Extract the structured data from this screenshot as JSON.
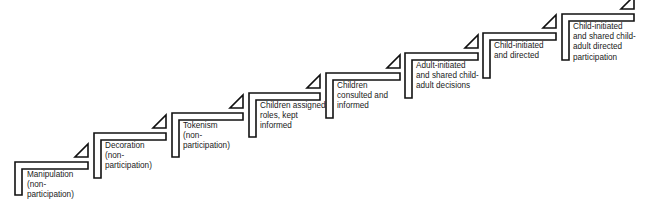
{
  "diagram": {
    "type": "ladder-of-participation-staircase",
    "colors": {
      "stroke": "#111111",
      "fill": "#ffffff",
      "text": "#1a1a1a"
    },
    "steps": [
      {
        "label": "Manipulation\n(non-\nparticipation)",
        "x": 15,
        "y": 162,
        "w": 73,
        "h": 33,
        "lx": 27,
        "ly": 170
      },
      {
        "label": "Decoration\n(non-\nparticipation)",
        "x": 94,
        "y": 133,
        "w": 72,
        "h": 45,
        "lx": 105,
        "ly": 141
      },
      {
        "label": "Tokenism\n(non-\nparticipation)",
        "x": 172,
        "y": 113,
        "w": 71,
        "h": 44,
        "lx": 183,
        "ly": 121
      },
      {
        "label": "Children assigned\nroles, kept\ninformed",
        "x": 249,
        "y": 93,
        "w": 71,
        "h": 44,
        "lx": 260,
        "ly": 101
      },
      {
        "label": "Children\nconsulted and\ninformed",
        "x": 326,
        "y": 73,
        "w": 74,
        "h": 45,
        "lx": 337,
        "ly": 81
      },
      {
        "label": "Adult-initiated\nand shared child-\nadult decisions",
        "x": 405,
        "y": 53,
        "w": 73,
        "h": 45,
        "lx": 416,
        "ly": 61
      },
      {
        "label": "Child-initiated\nand directed",
        "x": 483,
        "y": 33,
        "w": 73,
        "h": 45,
        "lx": 494,
        "ly": 41
      },
      {
        "label": "Child-initiated\nand shared child-\nadult directed\nparticipation",
        "x": 562,
        "y": 14,
        "w": 72,
        "h": 46,
        "lx": 573,
        "ly": 22
      }
    ]
  }
}
